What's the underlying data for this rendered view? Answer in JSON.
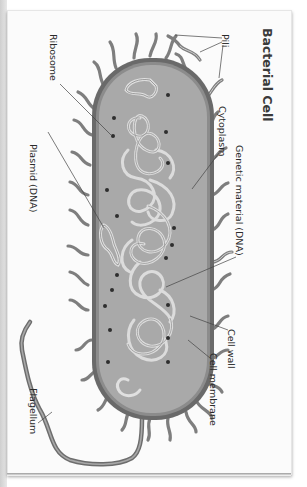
{
  "diagram": {
    "title": "Bacterial Cell",
    "orientation": "rotated 90° clockwise",
    "labels": [
      {
        "id": "pili",
        "text": "Pili"
      },
      {
        "id": "cytoplasm",
        "text": "Cytoplasm"
      },
      {
        "id": "genetic-material",
        "text": "Genetic material (DNA)"
      },
      {
        "id": "ribosome",
        "text": "Ribosome"
      },
      {
        "id": "plasmid",
        "text": "Plasmid (DNA)"
      },
      {
        "id": "cell-wall",
        "text": "Cell wall"
      },
      {
        "id": "cell-membrane",
        "text": "Cell membrane"
      },
      {
        "id": "flagellum",
        "text": "Flagellum"
      }
    ],
    "colors": {
      "cell_wall": "#6a6a6a",
      "cytoplasm": "#a9a9a9",
      "membrane": "#8c8c8c",
      "dna": "#d8d8d8",
      "ribosome": "#2e2e2e",
      "pili": "#8a8a8a",
      "background": "#fbfbfb"
    }
  }
}
